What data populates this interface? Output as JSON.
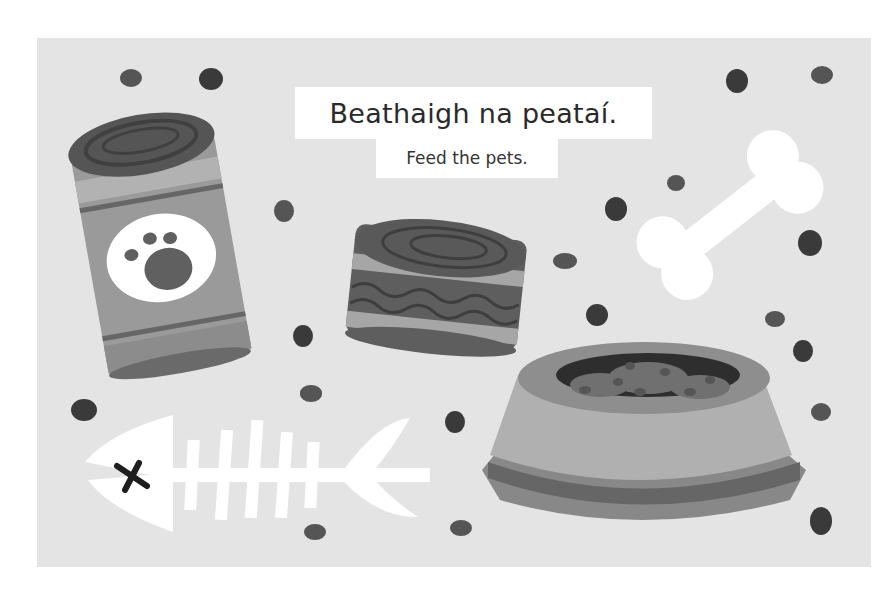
{
  "page": {
    "background": "#ffffff",
    "card_background": "#e4e4e4"
  },
  "heading": {
    "title": "Beathaigh na peataí.",
    "subtitle": "Feed the pets."
  },
  "illustrations": [
    {
      "name": "tall-pet-food-can",
      "icon": "paw-print-can"
    },
    {
      "name": "short-pet-food-can",
      "icon": "wavy-stripe-can"
    },
    {
      "name": "dog-bone",
      "icon": "bone"
    },
    {
      "name": "pet-food-bowl",
      "icon": "kibble-bowl"
    },
    {
      "name": "fish-skeleton",
      "icon": "fish-bone"
    }
  ],
  "colors": {
    "dark_gray": "#555555",
    "mid_gray": "#8a8a8a",
    "light_gray": "#a8a8a8",
    "kibble_dark": "#3a3a3a",
    "kibble_mid": "#555555",
    "white": "#ffffff"
  }
}
